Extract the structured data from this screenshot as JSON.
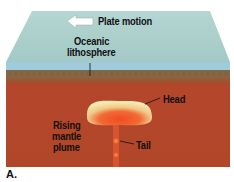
{
  "figure": {
    "caption": "A.",
    "labels": {
      "plate_motion": "Plate motion",
      "oceanic_lithosphere_line1": "Oceanic",
      "oceanic_lithosphere_line2": "lithosphere",
      "head": "Head",
      "rising_line1": "Rising",
      "rising_line2": "mantle",
      "rising_line3": "plume",
      "tail": "Tail"
    },
    "colors": {
      "ocean_surface": "#a9cdc8",
      "water_band": "#9cc9dc",
      "lithosphere": "#8a6a47",
      "mantle": "#b8452a",
      "plume_head_top": "#f3e8a8",
      "plume_core": "#f2542a"
    }
  }
}
